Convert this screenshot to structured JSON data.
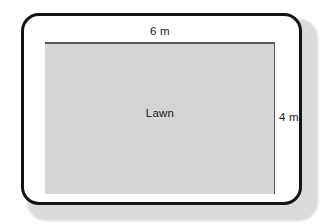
{
  "diagram": {
    "shape_label": "Lawn",
    "width_label": "6 m",
    "height_label": "4 m",
    "colors": {
      "fill": "#d5d5d5",
      "dimension_line": "#5a5a5a",
      "frame": "#141414",
      "background": "#ffffff",
      "shadow": "#d9d9d9",
      "text": "#1a1a1a"
    },
    "measurements": {
      "width_value": 6,
      "height_value": 4,
      "unit": "m"
    }
  }
}
